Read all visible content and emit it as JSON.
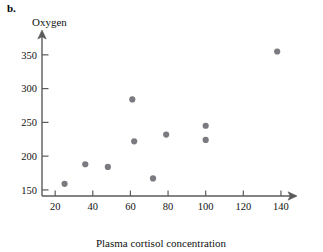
{
  "panel": {
    "label": "b."
  },
  "chart_data": {
    "type": "scatter",
    "title": "",
    "xlabel": "Plasma cortisol concentration",
    "ylabel": "Oxygen",
    "xlim": [
      13,
      148
    ],
    "ylim": [
      141,
      372
    ],
    "xticks": [
      20,
      40,
      60,
      80,
      100,
      120,
      140
    ],
    "xtick_labels": [
      "20",
      "40",
      "60",
      "80",
      "100",
      "120",
      "140"
    ],
    "yticks": [
      150,
      200,
      250,
      300,
      350
    ],
    "ytick_labels": [
      "150",
      "200",
      "250",
      "300",
      "350"
    ],
    "grid": false,
    "legend": false,
    "x": [
      25,
      36,
      48,
      61,
      62,
      72,
      79,
      100,
      100,
      138
    ],
    "y": [
      159,
      188,
      184,
      284,
      222,
      167,
      232,
      245,
      224,
      355
    ],
    "points": [
      {
        "x": 25,
        "y": 159
      },
      {
        "x": 36,
        "y": 188
      },
      {
        "x": 48,
        "y": 184
      },
      {
        "x": 61,
        "y": 284
      },
      {
        "x": 62,
        "y": 222
      },
      {
        "x": 72,
        "y": 167
      },
      {
        "x": 79,
        "y": 232
      },
      {
        "x": 100,
        "y": 245
      },
      {
        "x": 100,
        "y": 224
      },
      {
        "x": 138,
        "y": 355
      }
    ],
    "marker": {
      "shape": "circle",
      "color": "#7a7a80",
      "size": 3.1
    },
    "axis_color": "#5b5b5b"
  }
}
